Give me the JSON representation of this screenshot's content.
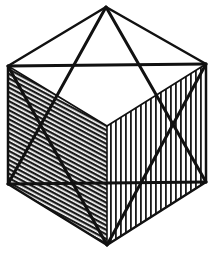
{
  "figure": {
    "stroke_color": "#111111",
    "background": "#ffffff",
    "vertices": {
      "top_apex": [
        106,
        7
      ],
      "upper_left": [
        8,
        66
      ],
      "upper_right": [
        206,
        64
      ],
      "front_center": [
        107,
        126
      ],
      "lower_left": [
        8,
        184
      ],
      "lower_right": [
        206,
        182
      ],
      "bottom_apex": [
        107,
        245
      ]
    }
  }
}
